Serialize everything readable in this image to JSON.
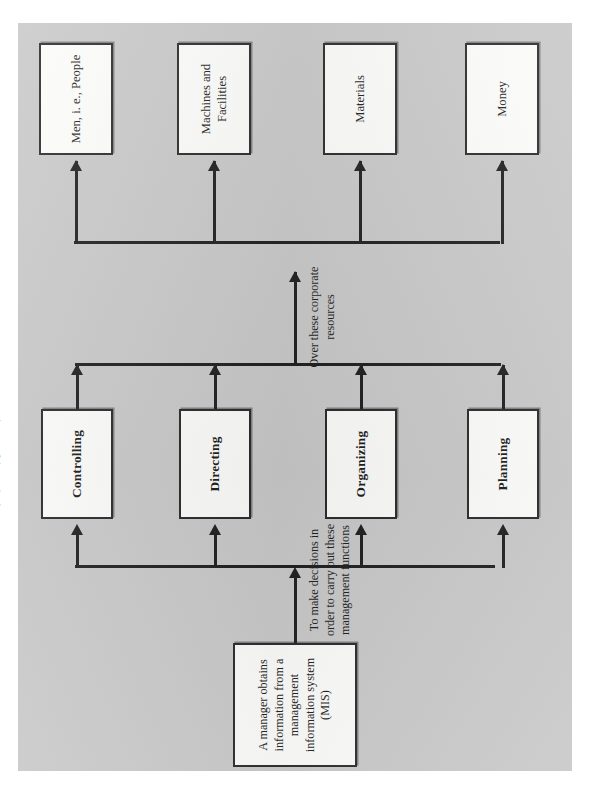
{
  "figure": {
    "type": "flowchart",
    "orientation": "rotated-90-ccw-on-page",
    "page_background": "#c9c9c9",
    "box_fill": "#fcfcfa",
    "line_color": "#1f1f1f",
    "source": {
      "label": "A manager obtains information from a management information system (MIS)"
    },
    "connector_labels": {
      "to_functions": "To make decisions in order to carry out these management functions",
      "to_resources": "Over these corporate resources"
    },
    "annotations": {
      "controlling_note": "(Refer to figure 1.2)"
    },
    "management_functions": [
      {
        "label": "Planning"
      },
      {
        "label": "Organizing"
      },
      {
        "label": "Directing"
      },
      {
        "label": "Controlling"
      }
    ],
    "corporate_resources": [
      {
        "label": "Money"
      },
      {
        "label": "Materials"
      },
      {
        "label": "Machines and Facilities"
      },
      {
        "label": "Men, i. e., People"
      }
    ]
  }
}
